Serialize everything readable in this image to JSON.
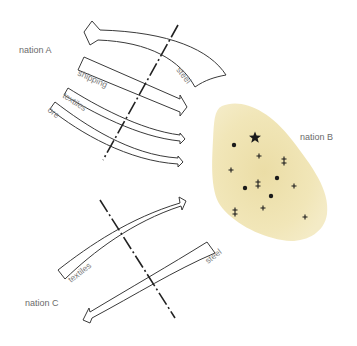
{
  "nations": {
    "a": {
      "label": "nation A"
    },
    "b": {
      "label": "nation B",
      "fill_color": "#efe3b0"
    },
    "c": {
      "label": "nation C"
    }
  },
  "flows_a_b": [
    {
      "label": "steel",
      "direction": "B to A"
    },
    {
      "label": "shipping",
      "direction": "A to B"
    },
    {
      "label": "textiles",
      "direction": "A to B"
    },
    {
      "label": "ore",
      "direction": "A to B"
    }
  ],
  "flows_c_b": [
    {
      "label": "textiles",
      "direction": "C to B"
    },
    {
      "label": "steel",
      "direction": "B to C"
    }
  ],
  "nation_b_symbols": [
    {
      "type": "star",
      "x": 255,
      "y": 137
    },
    {
      "type": "dot",
      "x": 234,
      "y": 145
    },
    {
      "type": "plus",
      "x": 259,
      "y": 156
    },
    {
      "type": "double-cross",
      "x": 284,
      "y": 161
    },
    {
      "type": "plus",
      "x": 231,
      "y": 170
    },
    {
      "type": "double-cross",
      "x": 258,
      "y": 184
    },
    {
      "type": "dot",
      "x": 277,
      "y": 178
    },
    {
      "type": "plus",
      "x": 294,
      "y": 186
    },
    {
      "type": "dot",
      "x": 245,
      "y": 188
    },
    {
      "type": "dot",
      "x": 271,
      "y": 196
    },
    {
      "type": "plus",
      "x": 263,
      "y": 208
    },
    {
      "type": "double-cross",
      "x": 235,
      "y": 212
    },
    {
      "type": "plus",
      "x": 305,
      "y": 217
    }
  ],
  "colors": {
    "outline": "#3a3a3a",
    "border_line": "#222222",
    "label_text": "#6b6b6b",
    "nation_b_fill": "#efe3b0"
  }
}
